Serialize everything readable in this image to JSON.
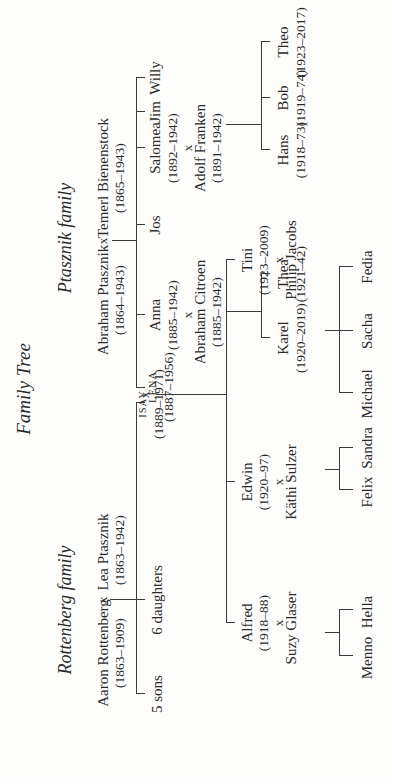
{
  "title": "Family Tree",
  "families": {
    "rottenberg": {
      "label": "Rottenberg family",
      "parent1": {
        "name": "Aaron Rottenberg",
        "dates": "(1863–1909)"
      },
      "marriage": "x",
      "parent2": {
        "name": "Lea Ptasznik",
        "dates": "(1863–1942)"
      },
      "children": [
        {
          "name": "5 sons"
        },
        {
          "name": "6 daughters"
        },
        {
          "name": "ISAY",
          "dates": "(1889–1971)"
        }
      ]
    },
    "ptasznik": {
      "label": "Ptasznik family",
      "parent1": {
        "name": "Abraham Ptasznik",
        "dates": "(1864–1943)"
      },
      "marriage": "x",
      "parent2": {
        "name": "Temerl Bienenstock",
        "dates": "(1865–1943)"
      },
      "children": [
        {
          "name": "LENA",
          "dates": "(1887–1956)"
        },
        {
          "name": "Anna",
          "dates": "(1885–1942)",
          "spouse": "Abraham Citroen",
          "spouse_dates": "(1885–1942)",
          "children": [
            {
              "name": "Karel",
              "dates": "(1920–2019)"
            },
            {
              "name": "Thea",
              "dates": "(1921–42)"
            }
          ]
        },
        {
          "name": "Jos"
        },
        {
          "name": "Salomea",
          "dates": "(1892–1942)",
          "spouse": "Adolf Franken",
          "spouse_dates": "(1891–1942)",
          "children": [
            {
              "name": "Hans",
              "dates": "(1918–73)"
            },
            {
              "name": "Bob",
              "dates": "(1919–74)"
            },
            {
              "name": "Theo",
              "dates": "(1923–2017)"
            }
          ]
        },
        {
          "name": "Jim"
        },
        {
          "name": "Willy"
        }
      ]
    }
  },
  "isay_lena": {
    "marriage": "x",
    "children": [
      {
        "name": "Alfred",
        "dates": "(1918–88)",
        "spouse": "Suzy Glaser",
        "children": [
          {
            "name": "Menno"
          },
          {
            "name": "Hella"
          }
        ]
      },
      {
        "name": "Edwin",
        "dates": "(1920–97)",
        "spouse": "Käthi Sulzer",
        "children": [
          {
            "name": "Felix"
          },
          {
            "name": "Sandra"
          }
        ]
      },
      {
        "name": "Tini",
        "dates": "(1923–2009)",
        "spouse": "Philip Jacobs",
        "children": [
          {
            "name": "Michael"
          },
          {
            "name": "Sacha"
          },
          {
            "name": "Fedia"
          }
        ]
      }
    ]
  },
  "colors": {
    "ink": "#2a2a2a",
    "paper": "#fdfdfc"
  }
}
